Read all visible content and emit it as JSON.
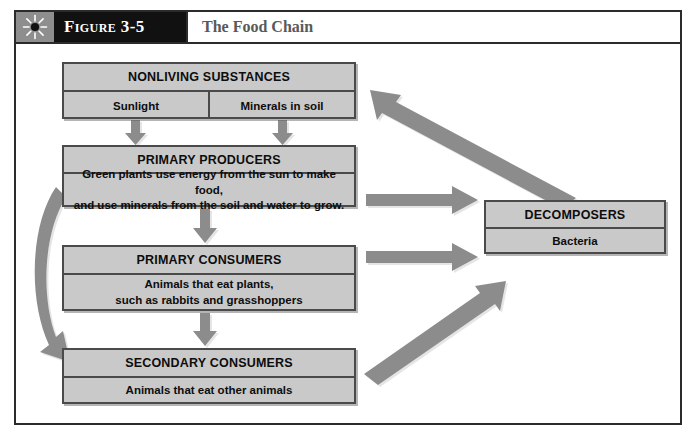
{
  "figure": {
    "icon": "sun-burst-icon",
    "label": "Figure 3-5",
    "title": "The Food Chain"
  },
  "colors": {
    "box_fill": "#c9c9c9",
    "box_border": "#4a4a4a",
    "arrow": "#8c8c8c",
    "header_label_bg": "#111111",
    "header_icon_bg": "#8e8e8e",
    "frame_border": "#2b2b2b",
    "title_text": "#595959"
  },
  "diagram": {
    "type": "flow-diagram",
    "nodes": [
      {
        "id": "nonliving",
        "title": "NONLIVING SUBSTANCES",
        "cells": [
          "Sunlight",
          "Minerals in soil"
        ]
      },
      {
        "id": "producers",
        "title": "PRIMARY PRODUCERS",
        "body_line1": "Green plants use energy from the sun to make food,",
        "body_line2": "and use minerals from the soil and water to grow."
      },
      {
        "id": "primary_consumers",
        "title": "PRIMARY CONSUMERS",
        "body_line1": "Animals that eat plants,",
        "body_line2": "such as rabbits and grasshoppers"
      },
      {
        "id": "secondary_consumers",
        "title": "SECONDARY CONSUMERS",
        "body_line1": "Animals that eat other animals"
      },
      {
        "id": "decomposers",
        "title": "DECOMPOSERS",
        "body_line1": "Bacteria"
      }
    ],
    "edges": [
      {
        "id": "sunlight-to-producers",
        "from": "nonliving",
        "to": "producers",
        "shape": "straight-down"
      },
      {
        "id": "minerals-to-producers",
        "from": "nonliving",
        "to": "producers",
        "shape": "straight-down"
      },
      {
        "id": "producers-to-primary",
        "from": "producers",
        "to": "primary_consumers",
        "shape": "straight-down"
      },
      {
        "id": "primary-to-secondary",
        "from": "primary_consumers",
        "to": "secondary_consumers",
        "shape": "straight-down"
      },
      {
        "id": "producers-to-decomposers",
        "from": "producers",
        "to": "decomposers",
        "shape": "straight-right"
      },
      {
        "id": "primary-to-decomposers",
        "from": "primary_consumers",
        "to": "decomposers",
        "shape": "straight-right"
      },
      {
        "id": "secondary-to-decomposers",
        "from": "secondary_consumers",
        "to": "decomposers",
        "shape": "diagonal-up-right"
      },
      {
        "id": "decomposers-to-nonliving",
        "from": "decomposers",
        "to": "nonliving",
        "shape": "diagonal-up-left"
      },
      {
        "id": "producers-to-secondary-curve",
        "from": "producers",
        "to": "secondary_consumers",
        "shape": "curved-left"
      }
    ]
  }
}
